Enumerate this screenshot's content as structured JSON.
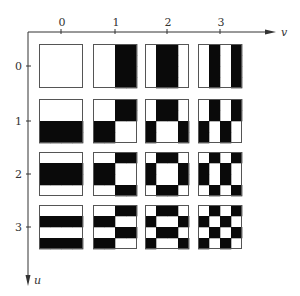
{
  "diagram": {
    "type": "basis-function-grid",
    "x_axis": {
      "label": "v",
      "ticks": [
        "0",
        "1",
        "2",
        "3"
      ]
    },
    "y_axis": {
      "label": "u",
      "ticks": [
        "0",
        "1",
        "2",
        "3"
      ]
    },
    "colors": {
      "black": "#0a0a0a",
      "white": "#ffffff",
      "border": "#555555",
      "axis": "#333333"
    },
    "sequences": [
      [
        1,
        1,
        1,
        1
      ],
      [
        1,
        1,
        -1,
        -1
      ],
      [
        1,
        -1,
        -1,
        1
      ],
      [
        1,
        -1,
        1,
        -1
      ]
    ],
    "note": "Cell (u,v) pixel (i,j) is white when sequences[u][i]*sequences[v][j] = +1, black when -1"
  }
}
